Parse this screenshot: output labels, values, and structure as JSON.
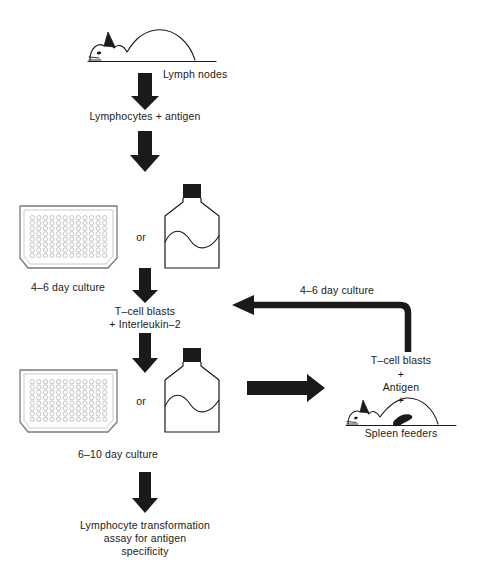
{
  "figure": {
    "background_color": "#ffffff",
    "ink_color": "#1a1a1a"
  },
  "labels": {
    "lymph_nodes": "Lymph nodes",
    "lymphocytes_antigen": "Lymphocytes + antigen",
    "culture_4_6_left": "4–6 day culture",
    "or_top": "or",
    "tcell_blasts_il2_line1": "T–cell blasts",
    "tcell_blasts_il2_line2": "+ Interleukin–2",
    "culture_4_6_right": "4–6 day culture",
    "or_bottom": "or",
    "culture_6_10": "6–10 day culture",
    "tcell_blasts_right": "T–cell blasts",
    "plus_1": "+",
    "antigen": "Antigen",
    "plus_2": "+",
    "spleen_feeders": "Spleen feeders",
    "assay_line1": "Lymphocyte transformation",
    "assay_line2": "assay for antigen",
    "assay_line3": "specificity"
  },
  "icons": {
    "mouse_top": "mouse-icon",
    "mouse_spleen": "mouse-with-spleen-icon",
    "plate_top": "microtiter-plate-icon",
    "plate_bottom": "microtiter-plate-icon",
    "flask_top": "culture-flask-icon",
    "flask_bottom": "culture-flask-icon",
    "arrow_1": "down-arrow-icon",
    "arrow_2": "down-arrow-icon",
    "arrow_3": "down-arrow-icon",
    "arrow_4": "down-arrow-icon",
    "arrow_right": "right-arrow-icon",
    "arrow_feedback": "feedback-elbow-arrow-icon"
  },
  "plate": {
    "rows": 8,
    "columns": 12,
    "total_wells": 96
  }
}
